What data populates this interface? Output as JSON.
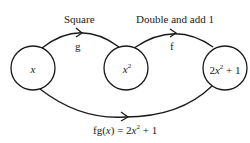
{
  "diagram": {
    "nodes": [
      {
        "id": "input",
        "var": "x",
        "label": "x"
      },
      {
        "id": "square-result",
        "var": "x",
        "power": "2",
        "label": "x^2"
      },
      {
        "id": "output",
        "coef": "2",
        "var": "x",
        "power": "2",
        "rest": " + 1",
        "label": "2x^2 + 1"
      }
    ],
    "edges": [
      {
        "from": "input",
        "to": "square-result",
        "name": "g",
        "description": "Square"
      },
      {
        "from": "square-result",
        "to": "output",
        "name": "f",
        "description": "Double and add 1"
      },
      {
        "from": "input",
        "to": "output",
        "name": "fg",
        "label_prefix": "fg(",
        "label_var": "x",
        "label_mid": ") = 2",
        "label_var2": "x",
        "label_power": "2",
        "label_suffix": " + 1",
        "label": "fg(x) = 2x^2 + 1"
      }
    ],
    "colors": {
      "stroke": "#1a1a1a",
      "background": "#ffffff"
    }
  }
}
